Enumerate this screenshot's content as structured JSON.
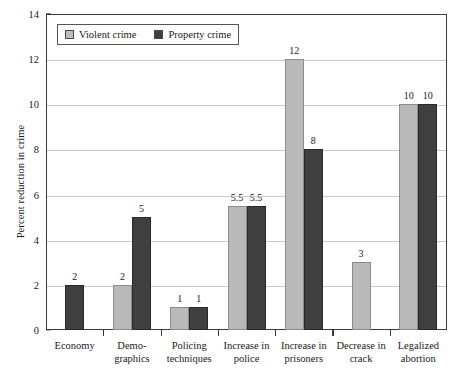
{
  "chart_data": {
    "type": "bar",
    "title": "",
    "xlabel": "",
    "ylabel": "Percent reduction in crime",
    "ylim": [
      0,
      14
    ],
    "yticks": [
      0,
      2,
      4,
      6,
      8,
      10,
      12,
      14
    ],
    "grid": true,
    "legend_position": "top-left",
    "categories": [
      "Economy",
      "Demographics",
      "Policing techniques",
      "Increase in police",
      "Increase in prisoners",
      "Decrease in crack",
      "Legalized abortion"
    ],
    "category_lines": [
      [
        "Economy",
        ""
      ],
      [
        "Demo-",
        "graphics"
      ],
      [
        "Policing",
        "techniques"
      ],
      [
        "Increase in",
        "police"
      ],
      [
        "Increase in",
        "prisoners"
      ],
      [
        "Decrease in",
        "crack"
      ],
      [
        "Legalized",
        "abortion"
      ]
    ],
    "series": [
      {
        "name": "Violent crime",
        "color": "#b9b9b9",
        "values": [
          null,
          2,
          1,
          5.5,
          12,
          3,
          10
        ],
        "labels": [
          "",
          "2",
          "1",
          "5.5",
          "12",
          "3",
          "10"
        ]
      },
      {
        "name": "Property crime",
        "color": "#3f3f3f",
        "values": [
          2,
          5,
          1,
          5.5,
          8,
          null,
          10
        ],
        "labels": [
          "2",
          "5",
          "1",
          "5.5",
          "8",
          "",
          "10"
        ]
      }
    ]
  },
  "legend": {
    "entries": [
      {
        "label": "Violent crime",
        "swatch": "violent-crime-swatch"
      },
      {
        "label": "Property crime",
        "swatch": "property-crime-swatch"
      }
    ]
  },
  "axis": {
    "y_title": "Percent reduction in crime",
    "y_tick_labels": [
      "0",
      "2",
      "4",
      "6",
      "8",
      "10",
      "12",
      "14"
    ]
  }
}
